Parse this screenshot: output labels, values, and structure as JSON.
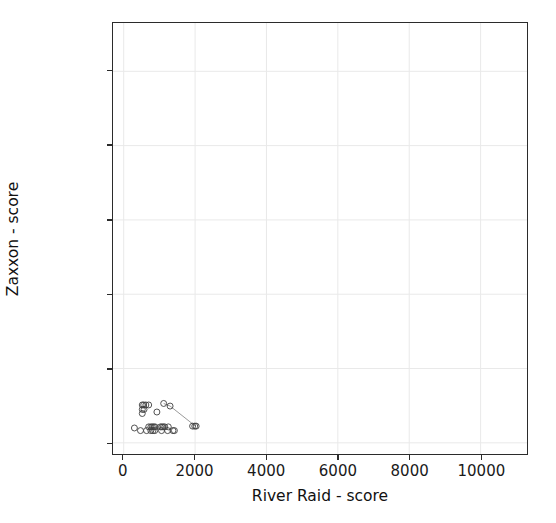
{
  "chart_data": {
    "type": "scatter",
    "title": "",
    "xlabel": "River Raid - score",
    "ylabel": "Zaxxon - score",
    "xlim": [
      -300,
      11300
    ],
    "ylim": [
      -300,
      11300
    ],
    "xticks": [
      0,
      2000,
      4000,
      6000,
      8000,
      10000
    ],
    "yticks": [
      0,
      2000,
      4000,
      6000,
      8000,
      10000
    ],
    "xtick_labels": [
      "0",
      "2000",
      "4000",
      "6000",
      "8000",
      "10000"
    ],
    "ytick_labels": [
      "0",
      "2000",
      "4000",
      "6000",
      "8000",
      "10000"
    ],
    "grid": true,
    "grid_color": "#e9e9e9",
    "legend": false,
    "marker": "open-circle",
    "marker_color": "#3f3f3f",
    "marker_size": 3,
    "line_color": "#9a9a9a",
    "points": [
      {
        "x": 520,
        "y": 1020
      },
      {
        "x": 560,
        "y": 1020
      },
      {
        "x": 620,
        "y": 1020
      },
      {
        "x": 700,
        "y": 1020
      },
      {
        "x": 520,
        "y": 900
      },
      {
        "x": 570,
        "y": 900
      },
      {
        "x": 520,
        "y": 790
      },
      {
        "x": 1120,
        "y": 1060
      },
      {
        "x": 1300,
        "y": 990
      },
      {
        "x": 930,
        "y": 830
      },
      {
        "x": 300,
        "y": 400
      },
      {
        "x": 470,
        "y": 330
      },
      {
        "x": 640,
        "y": 330
      },
      {
        "x": 700,
        "y": 430
      },
      {
        "x": 760,
        "y": 430
      },
      {
        "x": 800,
        "y": 430
      },
      {
        "x": 840,
        "y": 430
      },
      {
        "x": 880,
        "y": 430
      },
      {
        "x": 760,
        "y": 330
      },
      {
        "x": 820,
        "y": 330
      },
      {
        "x": 870,
        "y": 330
      },
      {
        "x": 1030,
        "y": 430
      },
      {
        "x": 1070,
        "y": 430
      },
      {
        "x": 1110,
        "y": 430
      },
      {
        "x": 1150,
        "y": 430
      },
      {
        "x": 1060,
        "y": 330
      },
      {
        "x": 1250,
        "y": 430
      },
      {
        "x": 1230,
        "y": 330
      },
      {
        "x": 1380,
        "y": 330
      },
      {
        "x": 1420,
        "y": 330
      },
      {
        "x": 1930,
        "y": 450
      },
      {
        "x": 1990,
        "y": 450
      },
      {
        "x": 2030,
        "y": 450
      }
    ],
    "connector_line": [
      {
        "x": 1120,
        "y": 1060
      },
      {
        "x": 1300,
        "y": 990
      },
      {
        "x": 2010,
        "y": 450
      }
    ]
  }
}
